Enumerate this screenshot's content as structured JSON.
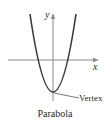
{
  "diagram": {
    "title": "Parabola",
    "axes": {
      "x_label": "x",
      "y_label": "y"
    },
    "curve": {
      "type": "parabola",
      "opens": "up",
      "vertex_px": [
        53,
        92
      ],
      "color": "#3a3a3a"
    },
    "annotations": [
      {
        "text": "Vertex",
        "points_to": "vertex"
      }
    ],
    "colors": {
      "axis": "#8a8a8a",
      "curve": "#3a3a3a",
      "text": "#2a2a2a",
      "background": "#ffffff"
    }
  }
}
